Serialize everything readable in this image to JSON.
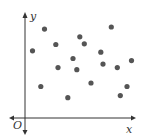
{
  "chart_data": {
    "type": "scatter",
    "title": "",
    "xlabel": "x",
    "ylabel": "y",
    "origin_label": "O",
    "grid": false,
    "legend": null,
    "point_color": "#555555",
    "axis_color": "#333333",
    "points": [
      {
        "x": 1.0,
        "y": 9.6
      },
      {
        "x": 2.6,
        "y": 12.7
      },
      {
        "x": 4.1,
        "y": 10.5
      },
      {
        "x": 4.4,
        "y": 7.2
      },
      {
        "x": 2.1,
        "y": 4.5
      },
      {
        "x": 5.7,
        "y": 2.9
      },
      {
        "x": 6.4,
        "y": 8.5
      },
      {
        "x": 6.9,
        "y": 6.9
      },
      {
        "x": 7.3,
        "y": 11.6
      },
      {
        "x": 7.9,
        "y": 10.6
      },
      {
        "x": 8.8,
        "y": 5.0
      },
      {
        "x": 10.1,
        "y": 9.4
      },
      {
        "x": 10.4,
        "y": 7.7
      },
      {
        "x": 11.5,
        "y": 13.0
      },
      {
        "x": 12.3,
        "y": 7.2
      },
      {
        "x": 14.2,
        "y": 8.2
      },
      {
        "x": 13.6,
        "y": 4.5
      },
      {
        "x": 12.7,
        "y": 3.2
      }
    ]
  }
}
